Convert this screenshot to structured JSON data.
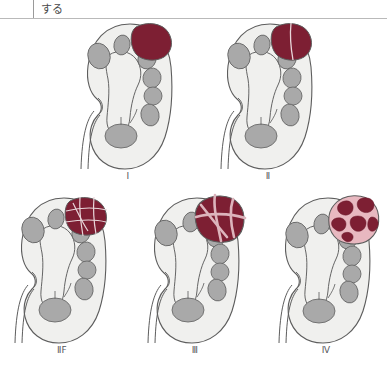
{
  "header": {
    "text": "する"
  },
  "figure": {
    "colors": {
      "kidney_fill": "#f0f0ee",
      "kidney_stroke": "#5d5d5d",
      "calyx_fill": "#a9a9a9",
      "calyx_stroke": "#6a6a6a",
      "cyst_dark_red": "#7d1f33",
      "cyst_pink": "#e8b8c0",
      "cyst_septum": "#d9b9c0",
      "cyst_stroke": "#5d5d5d",
      "label_color": "#56565a"
    },
    "panels": [
      {
        "id": "bosniak-1",
        "label": "Ⅰ",
        "cyst_type": "simple",
        "description": "Simple cyst, thin wall, no septa"
      },
      {
        "id": "bosniak-2",
        "label": "Ⅱ",
        "cyst_type": "few-thin-septa",
        "description": "A few hairline thin septa"
      },
      {
        "id": "bosniak-2f",
        "label": "ⅡF",
        "cyst_type": "multiple-thin-septa",
        "description": "Multiple hairline thin septa, minimal thickening"
      },
      {
        "id": "bosniak-3",
        "label": "Ⅲ",
        "cyst_type": "thick-irregular-septa",
        "description": "Thickened irregular enhancing walls or septa"
      },
      {
        "id": "bosniak-4",
        "label": "Ⅳ",
        "cyst_type": "enhancing-soft-tissue",
        "description": "Enhancing soft tissue components adjacent to septa"
      }
    ]
  }
}
